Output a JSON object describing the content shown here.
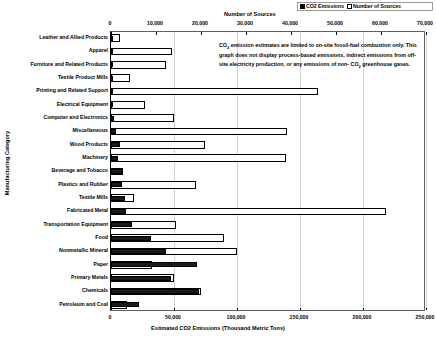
{
  "legend": {
    "items": [
      {
        "label": "CO2 Emissions",
        "swatch": "filled",
        "color": "#1a1a1a"
      },
      {
        "label": "Number of Sources",
        "swatch": "hollow",
        "color": "#ffffff"
      }
    ]
  },
  "annotation": {
    "line1": "CO",
    "sub1": "2",
    "line1b": " emission estimates are limited to on-site fossil-fuel combustion",
    "line2": "only.  This graph does not display process-based emissions, indirect",
    "line3": "emissions from off-site electricity production, or any emissions of non-",
    "line4": "CO",
    "sub4": "2",
    "line4b": " greenhouse gases."
  },
  "chart_data": {
    "type": "bar",
    "orientation": "horizontal",
    "title": "",
    "xlabel": "Estimated CO2 Emissions (Thousand Metric Tons)",
    "ylabel": "Manufacturing Category",
    "top_axis_label": "Number of Sources",
    "grid": true,
    "legend_position": "top-right",
    "xlim": [
      0,
      250000
    ],
    "xticks": [
      0,
      50000,
      100000,
      150000,
      200000,
      250000
    ],
    "xticklabels": [
      "0",
      "50,000",
      "100,000",
      "150,000",
      "200,000",
      "250,000"
    ],
    "top_xlim": [
      0,
      70000
    ],
    "top_xticks": [
      0,
      10000,
      20000,
      30000,
      40000,
      50000,
      60000,
      70000
    ],
    "top_xticklabels": [
      "0",
      "10,000",
      "20,000",
      "30,000",
      "40,000",
      "50,000",
      "60,000",
      "70,000"
    ],
    "categories": [
      "Leather and Allied Products",
      "Apparel",
      "Furniture and Related Products",
      "Textile Product Mills",
      "Printing and Related Support",
      "Electrical Equipment",
      "Computer and Electronics",
      "Miscellaneous",
      "Wood Products",
      "Machinery",
      "Beverage and Tobacco",
      "Plastics and Rubber",
      "Textile Mills",
      "Fabricated Metal",
      "Transportation Equipment",
      "Food",
      "Nonmetallic Mineral",
      "Paper",
      "Primary Metals",
      "Chemicals",
      "Petroleum and Coal"
    ],
    "series": [
      {
        "name": "CO2 Emissions",
        "unit": "Thousand Metric Tons",
        "axis": "bottom",
        "values": [
          900,
          1100,
          1400,
          1600,
          1800,
          1900,
          2200,
          4200,
          7000,
          5200,
          8600,
          9000,
          11000,
          12000,
          17000,
          32000,
          44000,
          68000,
          48000,
          70000,
          22000
        ]
      },
      {
        "name": "Number of Sources",
        "unit": "sources",
        "axis": "top",
        "values": [
          1900,
          13500,
          12300,
          4300,
          46000,
          7600,
          13900,
          39000,
          20800,
          38800,
          2700,
          18800,
          5200,
          61000,
          14500,
          25000,
          28000,
          9000,
          14000,
          20000,
          3600
        ]
      }
    ]
  }
}
